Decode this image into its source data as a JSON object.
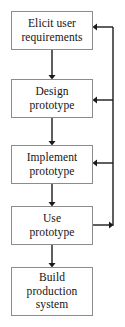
{
  "diagram": {
    "type": "flowchart",
    "background_color": "#ffffff",
    "line_color": "#1a1a1a",
    "box_border_color": "#8c8c8c",
    "text_color": "#141414",
    "boxes": [
      {
        "id": "elicit-user-requirements",
        "lines": [
          "Elicit user",
          "requirements"
        ],
        "line1": "Elicit user",
        "line2": "requirements",
        "line3": "",
        "x": 11,
        "y": 11,
        "width": 82,
        "height": 39
      },
      {
        "id": "design-prototype",
        "lines": [
          "Design",
          "prototype"
        ],
        "line1": "Design",
        "line2": "prototype",
        "line3": "",
        "x": 11,
        "y": 79,
        "width": 82,
        "height": 39
      },
      {
        "id": "implement-prototype",
        "lines": [
          "Implement",
          "prototype"
        ],
        "line1": "Implement",
        "line2": "prototype",
        "line3": "",
        "x": 11,
        "y": 145,
        "width": 82,
        "height": 39
      },
      {
        "id": "use-prototype",
        "lines": [
          "Use",
          "prototype"
        ],
        "line1": "Use",
        "line2": "prototype",
        "line3": "",
        "x": 11,
        "y": 206,
        "width": 82,
        "height": 39
      },
      {
        "id": "build-production-system",
        "lines": [
          "Build",
          "production",
          "system"
        ],
        "line1": "Build",
        "line2": "production",
        "line3": "system",
        "x": 11,
        "y": 267,
        "width": 82,
        "height": 49
      }
    ],
    "connectors": [
      {
        "id": "elicit-to-design",
        "from": "elicit-user-requirements",
        "to": "design-prototype",
        "direction": "down"
      },
      {
        "id": "design-to-implement",
        "from": "design-prototype",
        "to": "implement-prototype",
        "direction": "down"
      },
      {
        "id": "implement-to-use",
        "from": "implement-prototype",
        "to": "use-prototype",
        "direction": "down"
      },
      {
        "id": "use-to-build",
        "from": "use-prototype",
        "to": "build-production-system",
        "direction": "down"
      }
    ],
    "feedback": [
      {
        "id": "use-to-elicit-feedback",
        "from": "use-prototype",
        "to": "elicit-user-requirements",
        "direction": "left"
      },
      {
        "id": "use-to-design-feedback",
        "from": "use-prototype",
        "to": "design-prototype",
        "direction": "left"
      },
      {
        "id": "use-to-implement-feedback",
        "from": "use-prototype",
        "to": "implement-prototype",
        "direction": "left"
      }
    ]
  }
}
